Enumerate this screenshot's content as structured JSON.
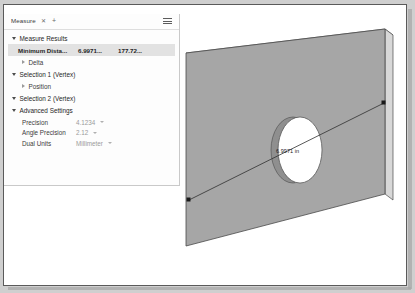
{
  "window": {
    "title": "CAD Measure Window"
  },
  "panel": {
    "tab": {
      "label": "Measure",
      "close_icon": "close-icon",
      "add_icon": "plus-icon"
    },
    "menu_icon": "hamburger-menu-icon",
    "sections": [
      {
        "id": "measure-results",
        "label": "Measure Results",
        "expanded": true
      },
      {
        "id": "selection-1",
        "label": "Selection 1 (Vertex)",
        "expanded": true
      },
      {
        "id": "selection-2",
        "label": "Selection 2 (Vertex)",
        "expanded": true
      },
      {
        "id": "advanced-settings",
        "label": "Advanced Settings",
        "expanded": true
      }
    ],
    "result_row": {
      "label": "Minimum Dista...",
      "value_1": "6.9971...",
      "value_2": "177.72..."
    },
    "sub_items": {
      "delta": "Delta",
      "position": "Position"
    },
    "settings": [
      {
        "label": "Precision",
        "value": "4.1234"
      },
      {
        "label": "Angle Precision",
        "value": "2.12"
      },
      {
        "label": "Dual Units",
        "value": "Millimeter"
      }
    ]
  },
  "viewport": {
    "dimension_label": "6.9971 in",
    "part_name": "plate-with-hole",
    "colors": {
      "face_front": "#a6a6a6",
      "face_side": "#d8d8d8",
      "face_top": "#efefef",
      "hole_fill": "#ffffff",
      "hole_wall": "#9a9a9a",
      "edge": "#4a4a4a",
      "background": "#ffffff"
    }
  }
}
